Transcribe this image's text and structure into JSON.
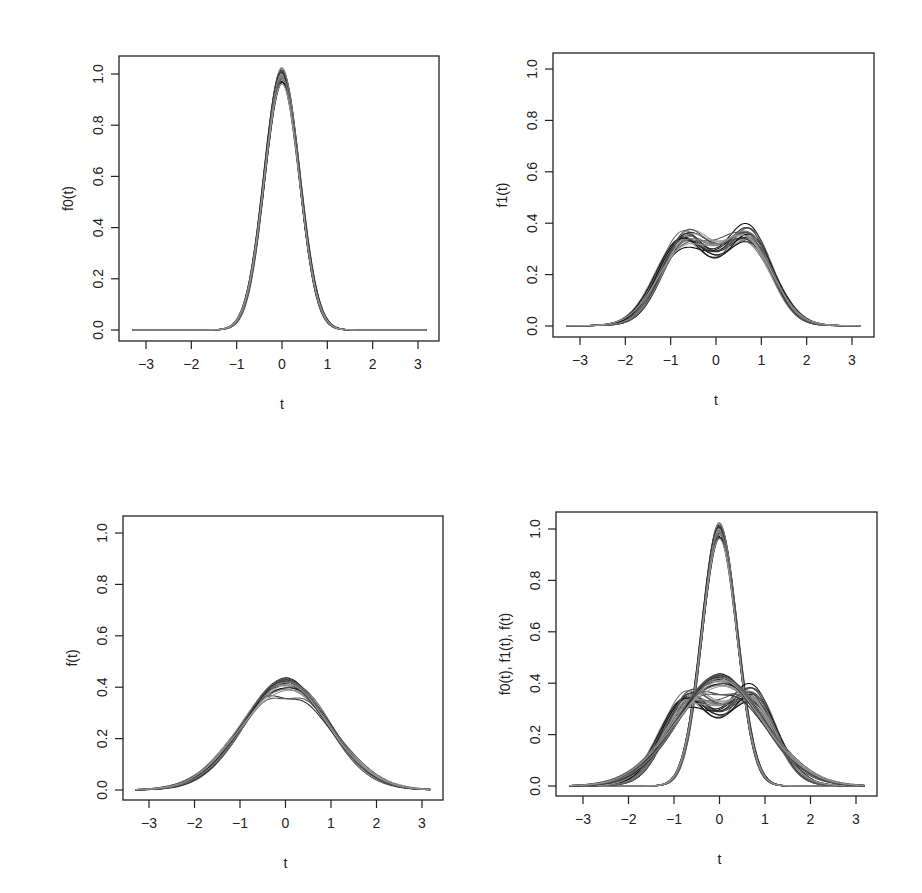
{
  "figure": {
    "layout": "2x2 grid of line plots (families of estimated density curves)",
    "background": "#ffffff",
    "line_colors": [
      "#111111",
      "#333333",
      "#555555",
      "#777777",
      "#999999"
    ]
  },
  "chart_data": [
    {
      "id": "top-left",
      "type": "line",
      "title": "",
      "xlabel": "t",
      "ylabel": "f0(t)",
      "xlim": [
        -3.3,
        3.2
      ],
      "ylim": [
        0.0,
        1.05
      ],
      "xticks": [
        -3,
        -2,
        -1,
        0,
        1,
        2,
        3
      ],
      "xtick_labels": [
        "−3",
        "−2",
        "−1",
        "0",
        "1",
        "2",
        "3"
      ],
      "yticks": [
        0.0,
        0.2,
        0.4,
        0.6,
        0.8,
        1.0
      ],
      "ytick_labels": [
        "0.0",
        "0.2",
        "0.4",
        "0.6",
        "0.8",
        "1.0"
      ],
      "grid": false,
      "legend": null,
      "description": "About 20 overlapping bell-shaped curves (normal-like, sd ≈ 0.4) peaking at t ≈ 0 with peak heights 0.96–1.03",
      "family": "f0",
      "n_curves": 20,
      "peak_range": [
        0.96,
        1.03
      ],
      "approx_points": {
        "t": [
          -3.3,
          -2,
          -1.5,
          -1,
          -0.5,
          0,
          0.5,
          1,
          1.5,
          2,
          3.2
        ],
        "y": [
          0.0,
          0.0,
          0.01,
          0.05,
          0.46,
          1.0,
          0.46,
          0.05,
          0.01,
          0.0,
          0.0
        ]
      }
    },
    {
      "id": "top-right",
      "type": "line",
      "title": "",
      "xlabel": "t",
      "ylabel": "f1(t)",
      "xlim": [
        -3.3,
        3.2
      ],
      "ylim": [
        0.0,
        1.05
      ],
      "xticks": [
        -3,
        -2,
        -1,
        0,
        1,
        2,
        3
      ],
      "xtick_labels": [
        "−3",
        "−2",
        "−1",
        "0",
        "1",
        "2",
        "3"
      ],
      "yticks": [
        0.0,
        0.2,
        0.4,
        0.6,
        0.8,
        1.0
      ],
      "ytick_labels": [
        "0.0",
        "0.2",
        "0.4",
        "0.6",
        "0.8",
        "1.0"
      ],
      "grid": false,
      "legend": null,
      "description": "About 20 bimodal curves with modes near t ≈ ±0.7 (heights 0.33–0.38) and a central dip at t ≈ 0 (0.19–0.30)",
      "family": "f1",
      "n_curves": 20,
      "mode_height_range": [
        0.33,
        0.38
      ],
      "dip_range": [
        0.19,
        0.3
      ],
      "approx_points": {
        "t": [
          -3.3,
          -2,
          -1.5,
          -1,
          -0.7,
          0,
          0.7,
          1,
          1.5,
          2,
          3.2
        ],
        "y": [
          0.0,
          0.06,
          0.16,
          0.3,
          0.35,
          0.26,
          0.35,
          0.3,
          0.16,
          0.06,
          0.01
        ]
      }
    },
    {
      "id": "bottom-left",
      "type": "line",
      "title": "",
      "xlabel": "t",
      "ylabel": "f(t)",
      "xlim": [
        -3.3,
        3.2
      ],
      "ylim": [
        0.0,
        1.05
      ],
      "xticks": [
        -3,
        -2,
        -1,
        0,
        1,
        2,
        3
      ],
      "xtick_labels": [
        "−3",
        "−2",
        "−1",
        "0",
        "1",
        "2",
        "3"
      ],
      "yticks": [
        0.0,
        0.2,
        0.4,
        0.6,
        0.8,
        1.0
      ],
      "ytick_labels": [
        "0.0",
        "0.2",
        "0.4",
        "0.6",
        "0.8",
        "1.0"
      ],
      "grid": false,
      "legend": null,
      "description": "About 20 unimodal wide bell curves (sd ≈ 1) peaking at t ≈ 0 with heights 0.37–0.44; one curve has slight dip at center",
      "family": "f",
      "n_curves": 20,
      "peak_range": [
        0.37,
        0.44
      ],
      "approx_points": {
        "t": [
          -3.3,
          -2,
          -1.5,
          -1,
          -0.5,
          0,
          0.5,
          1,
          1.5,
          2,
          3.2
        ],
        "y": [
          0.0,
          0.05,
          0.13,
          0.24,
          0.35,
          0.41,
          0.35,
          0.24,
          0.13,
          0.05,
          0.01
        ]
      }
    },
    {
      "id": "bottom-right",
      "type": "line",
      "title": "",
      "xlabel": "t",
      "ylabel": "f0(t), f1(t), f(t)",
      "xlim": [
        -3.3,
        3.2
      ],
      "ylim": [
        0.0,
        1.05
      ],
      "xticks": [
        -3,
        -2,
        -1,
        0,
        1,
        2,
        3
      ],
      "xtick_labels": [
        "−3",
        "−2",
        "−1",
        "0",
        "1",
        "2",
        "3"
      ],
      "yticks": [
        0.0,
        0.2,
        0.4,
        0.6,
        0.8,
        1.0
      ],
      "ytick_labels": [
        "0.0",
        "0.2",
        "0.4",
        "0.6",
        "0.8",
        "1.0"
      ],
      "grid": false,
      "legend": null,
      "description": "Overlay of all three families: f0 (tall narrow peak ≈ 1.0), f1 (bimodal ≈ 0.35 with dip), f (wide bell ≈ 0.41)",
      "family": "all",
      "n_curves": 60
    }
  ]
}
